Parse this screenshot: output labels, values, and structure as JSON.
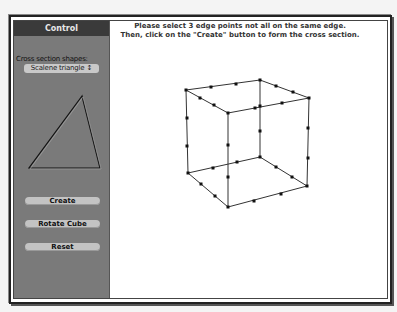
{
  "panel": {
    "title": "Control",
    "shape_label": "Cross section shapes:",
    "shape_selected": "Scalene triangle",
    "buttons": {
      "create": "Create",
      "rotate": "Rotate Cube",
      "reset": "Reset"
    }
  },
  "main": {
    "instruction_line1": "Please select 3 edge points not all on the same edge.",
    "instruction_line2": "Then, click on the \"Create\" button to form the cross section."
  },
  "colors": {
    "panel_bg": "#7a7a7a",
    "panel_title_bg": "#3a3a3a",
    "button_bg": "#c3c3c3"
  }
}
